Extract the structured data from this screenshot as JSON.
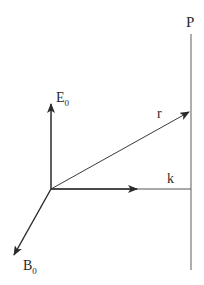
{
  "diagram": {
    "type": "vector-geometry",
    "colors": {
      "background": "#ffffff",
      "stroke": "#2a2a2a",
      "plane_line": "#777777"
    },
    "labels": {
      "plane": "P",
      "r_vector": "r",
      "k_vector": "k",
      "e_field": {
        "main": "E",
        "subscript": "0"
      },
      "b_field": {
        "main": "B",
        "subscript": "0"
      }
    },
    "geometry": {
      "origin": [
        51,
        189
      ],
      "e_field_tip": [
        51,
        103
      ],
      "r_vector_tip": [
        190,
        111
      ],
      "k_arrowhead": [
        136,
        189
      ],
      "k_line_end": [
        191,
        189
      ],
      "b_field_tip": [
        13,
        256
      ],
      "plane_x": 191,
      "plane_y_range": [
        34,
        270
      ]
    }
  }
}
